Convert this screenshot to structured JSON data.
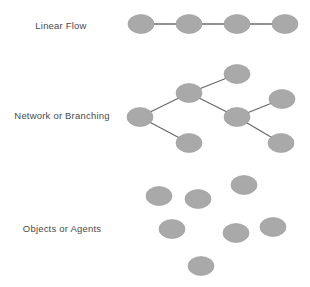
{
  "colors": {
    "node": "#a9a9a9",
    "node_edge": "#9c9c9c",
    "link": "#6a6a6a",
    "text": "#4a4a4a"
  },
  "sections": [
    {
      "id": "linear",
      "label": "Linear Flow",
      "label_pos": [
        61,
        25
      ],
      "nodes": [
        [
          141,
          24
        ],
        [
          189,
          24
        ],
        [
          237,
          24
        ],
        [
          285,
          24
        ]
      ],
      "links": [
        [
          0,
          1
        ],
        [
          1,
          2
        ],
        [
          2,
          3
        ]
      ]
    },
    {
      "id": "network",
      "label": "Network or Branching",
      "label_pos": [
        62,
        115
      ],
      "nodes": [
        [
          140,
          117
        ],
        [
          189,
          93
        ],
        [
          237,
          74
        ],
        [
          237,
          117
        ],
        [
          282,
          99
        ],
        [
          281,
          143
        ],
        [
          189,
          143
        ]
      ],
      "links": [
        [
          0,
          1
        ],
        [
          1,
          2
        ],
        [
          1,
          3
        ],
        [
          3,
          4
        ],
        [
          3,
          5
        ],
        [
          0,
          6
        ]
      ]
    },
    {
      "id": "objects",
      "label": "Objects or Agents",
      "label_pos": [
        62,
        228
      ],
      "nodes": [
        [
          159,
          196
        ],
        [
          198,
          199
        ],
        [
          244,
          185
        ],
        [
          172,
          229
        ],
        [
          236,
          233
        ],
        [
          273,
          227
        ],
        [
          201,
          266
        ]
      ],
      "links": []
    }
  ],
  "node_size": {
    "rx": 13,
    "ry": 9.5
  }
}
